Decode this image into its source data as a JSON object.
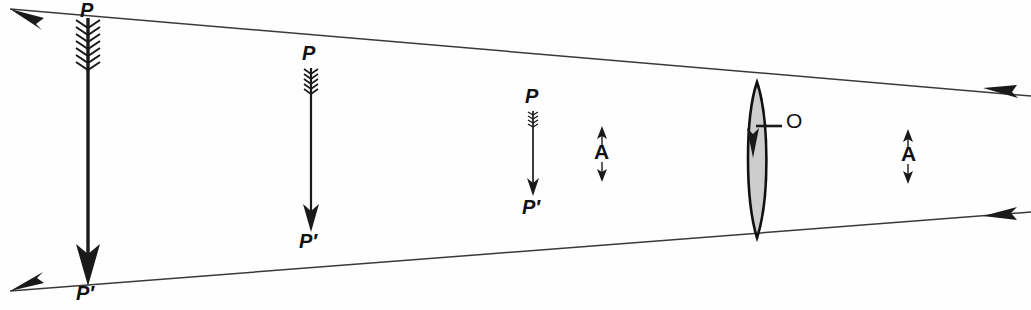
{
  "figure": {
    "kind": "optics-ray-diagram",
    "width": 1031,
    "height": 310,
    "background_color": "#fefefe",
    "ink_color": "#1a1a1a",
    "lens_fill_color": "#cdcdcd",
    "lens_stroke_color": "#111111",
    "ray_stroke_color": "#3a3a3a"
  },
  "cropped_header_text": "",
  "labels": {
    "object_p": "P",
    "image_p_prime": "P′",
    "angle_a": "A",
    "optical_center_o": "O"
  },
  "arrows": [
    {
      "id": "arrow-large",
      "label_top": "P",
      "label_bottom": "P′",
      "x": 88,
      "top_y": 14,
      "bottom_y": 286,
      "shaft_width": 3.4,
      "fletching": "large",
      "head": "large"
    },
    {
      "id": "arrow-medium",
      "label_top": "P",
      "label_bottom": "P′",
      "x": 311,
      "top_y": 66,
      "bottom_y": 232,
      "shaft_width": 2.4,
      "fletching": "medium",
      "head": "medium"
    },
    {
      "id": "arrow-small",
      "label_top": "P",
      "label_bottom": "P′",
      "x": 533,
      "top_y": 110,
      "bottom_y": 196,
      "shaft_width": 1.8,
      "fletching": "small",
      "head": "small"
    }
  ],
  "lens": {
    "id": "converging-lens",
    "center_x": 757,
    "center_y": 160,
    "top_y": 82,
    "bottom_y": 238,
    "half_thickness": 12,
    "label": "O",
    "label_x": 789,
    "label_y": 116
  },
  "rays": [
    {
      "id": "ray-upper",
      "from": {
        "x": 8,
        "y": 8
      },
      "to": {
        "x": 1031,
        "y": 96
      },
      "crosses_at": {
        "x": 757,
        "y": 155
      },
      "left_arrowhead": true,
      "right_arrowhead": true,
      "description": "upper ray from P through lens center to lower right"
    },
    {
      "id": "ray-lower",
      "from": {
        "x": 8,
        "y": 292
      },
      "to": {
        "x": 1031,
        "y": 212
      },
      "crosses_at": {
        "x": 757,
        "y": 155
      },
      "left_arrowhead": true,
      "right_arrowhead": true,
      "description": "lower ray from P-prime through lens center to upper right"
    }
  ],
  "angle_markers": [
    {
      "id": "angle-marker-left",
      "label": "A",
      "x": 602,
      "top_y": 126,
      "bottom_y": 182,
      "label_x": 594,
      "label_y": 146
    },
    {
      "id": "angle-marker-right",
      "label": "A",
      "x": 908,
      "top_y": 129,
      "bottom_y": 184,
      "label_x": 900,
      "label_y": 148
    }
  ],
  "text_labels": [
    {
      "id": "label-p-1",
      "text": "P",
      "x": 80,
      "y": 2
    },
    {
      "id": "label-pp-1",
      "text": "P′",
      "x": 78,
      "y": 284
    },
    {
      "id": "label-p-2",
      "text": "P",
      "x": 303,
      "y": 44
    },
    {
      "id": "label-pp-2",
      "text": "P′",
      "x": 301,
      "y": 234
    },
    {
      "id": "label-p-3",
      "text": "P",
      "x": 526,
      "y": 85
    },
    {
      "id": "label-pp-3",
      "text": "P′",
      "x": 524,
      "y": 198
    },
    {
      "id": "label-a-1",
      "text": "A",
      "x": 594,
      "y": 142
    },
    {
      "id": "label-a-2",
      "text": "A",
      "x": 901,
      "y": 144
    },
    {
      "id": "label-o",
      "text": "O",
      "x": 787,
      "y": 112
    }
  ]
}
